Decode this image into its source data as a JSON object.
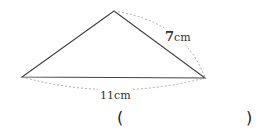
{
  "figure": {
    "shape": "triangle",
    "side_right": {
      "value": "7",
      "unit": "cm"
    },
    "side_bottom": {
      "value": "11",
      "unit": "cm"
    }
  },
  "answer": {
    "open": "(",
    "close": ")",
    "value": ""
  }
}
